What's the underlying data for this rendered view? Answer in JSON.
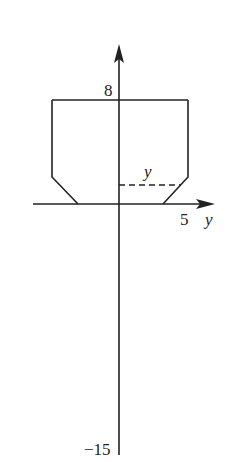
{
  "diagram": {
    "labels": {
      "top_tick": "8",
      "bottom_tick": "−15",
      "right_tick": "5",
      "axis_label": "y",
      "dash_label": "y"
    },
    "colors": {
      "stroke": "#222222",
      "background": "#ffffff"
    }
  }
}
